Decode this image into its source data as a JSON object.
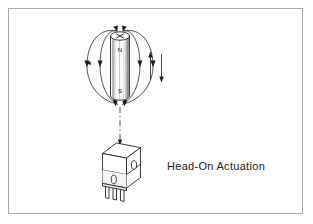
{
  "figure": {
    "caption": "Head-On Actuation",
    "background_color": "#ffffff",
    "border_color": "#a8a8a8",
    "ink_color": "#1a1a1a"
  },
  "magnet": {
    "name": "cylindrical bar magnet",
    "north_label": "N",
    "south_label": "S",
    "top_face_marker": "x-cross-mark",
    "orientation": "vertical",
    "body_fill": "#fbfbfb",
    "shading_color": "#9a9a9a"
  },
  "field": {
    "name": "magnetic flux lines",
    "line_count": 4,
    "arrow_direction": "north-to-south",
    "description": "flux loops from top pole around both sides to bottom pole"
  },
  "motion_arrows": {
    "name": "approach and retract motion",
    "arrows": [
      {
        "label": "up",
        "direction": "up"
      },
      {
        "label": "down",
        "direction": "down"
      }
    ]
  },
  "centerline": {
    "name": "alignment axis",
    "style": "dash-dot"
  },
  "sensor": {
    "name": "hall effect sensor switch",
    "pin_count": 3,
    "slot_count": 2,
    "body_fill": "#ffffff",
    "band_fill": "#f2f2f2"
  }
}
